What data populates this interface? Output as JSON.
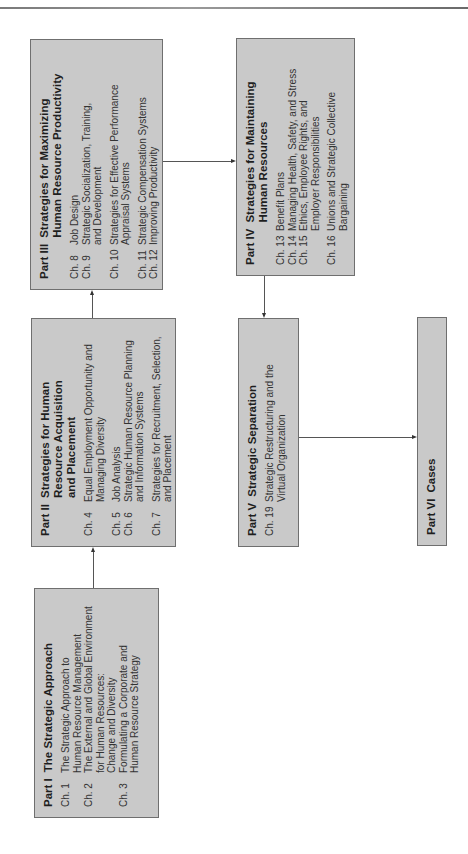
{
  "diagram": {
    "parts": [
      {
        "id": "part1",
        "number": "Part I",
        "title": "The Strategic Approach",
        "chapters": [
          {
            "num": "Ch. 1",
            "title": "The Strategic Approach to\nHuman Resource Management"
          },
          {
            "num": "Ch. 2",
            "title": "The External and Global Environment\nfor Human Resources:\nChange and Diversity"
          },
          {
            "num": "Ch. 3",
            "title": "Formulating a Corporate and\nHuman Resource Strategy"
          }
        ]
      },
      {
        "id": "part2",
        "number": "Part II",
        "title": "Strategies for Human\nResource Acquisition\nand Placement",
        "chapters": [
          {
            "num": "Ch. 4",
            "title": "Equal Employment Opportunity and\nManaging Diversity"
          },
          {
            "num": "Ch. 5",
            "title": "Job Analysis"
          },
          {
            "num": "Ch. 6",
            "title": "Strategic Human Resource Planning\nand Information Systems"
          },
          {
            "num": "Ch. 7",
            "title": "Strategies for Recruitment, Selection,\nand Placement"
          }
        ]
      },
      {
        "id": "part3",
        "number": "Part III",
        "title": "Strategies for Maximizing\nHuman Resource Productivity",
        "chapters": [
          {
            "num": "Ch. 8",
            "title": "Job Design"
          },
          {
            "num": "Ch. 9",
            "title": "Strategic Socialization, Training,\nand Development"
          },
          {
            "num": "Ch. 10",
            "title": "Strategies for Effective Performance\nAppraisal Systems"
          },
          {
            "num": "Ch. 11",
            "title": "Strategic Compensation Systems"
          },
          {
            "num": "Ch. 12",
            "title": "Improving Productivity"
          }
        ]
      },
      {
        "id": "part4",
        "number": "Part IV",
        "title": "Strategies for Maintaining\nHuman Resources",
        "chapters": [
          {
            "num": "Ch. 13",
            "title": "Benefit Plans"
          },
          {
            "num": "Ch. 14",
            "title": "Managing Health, Safety, and Stress"
          },
          {
            "num": "Ch. 15",
            "title": "Ethics, Employee Rights, and\nEmployer Responsibilities"
          },
          {
            "num": "Ch. 16",
            "title": "Unions and Strategic Collective\nBargaining"
          }
        ]
      },
      {
        "id": "part5",
        "number": "Part V",
        "title": "Strategic Separation",
        "chapters": [
          {
            "num": "Ch. 19",
            "title": "Strategic Restructuring and the\nVirtual Organization"
          }
        ]
      },
      {
        "id": "part6",
        "number": "Part VI",
        "title": "Cases",
        "chapters": []
      }
    ],
    "flow": [
      {
        "from": "Part I",
        "to": "Part II"
      },
      {
        "from": "Part II",
        "to": "Part III"
      },
      {
        "from": "Part III",
        "to": "Part IV"
      },
      {
        "from": "Part IV",
        "to": "Part V"
      },
      {
        "from": "Part V",
        "to": "Part VI"
      }
    ],
    "colors": {
      "box_fill": "#c9c9c9",
      "box_border": "#6f6f6f",
      "connector": "#555555"
    }
  }
}
